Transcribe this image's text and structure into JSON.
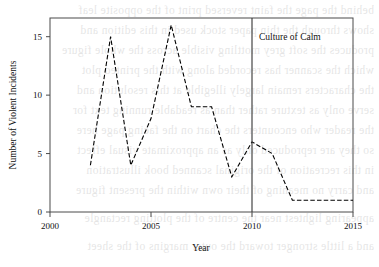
{
  "chart_data": {
    "type": "line",
    "title": "",
    "xlabel": "Year",
    "ylabel": "Number of Violent Incidents",
    "xlim": [
      2000,
      2015
    ],
    "ylim": [
      0,
      16.6
    ],
    "grid": false,
    "legend": "none",
    "x": [
      2002,
      2003,
      2004,
      2005,
      2006,
      2007,
      2008,
      2009,
      2010,
      2011,
      2012,
      2013,
      2014,
      2015
    ],
    "values": [
      4,
      15,
      4,
      8,
      16,
      9,
      9,
      3,
      6,
      5,
      1,
      1,
      1,
      1
    ],
    "series": [
      {
        "name": "Violent incidents",
        "values": [
          4,
          15,
          4,
          8,
          16,
          9,
          9,
          3,
          6,
          5,
          1,
          1,
          1,
          1
        ]
      }
    ],
    "xticks": [
      2000,
      2005,
      2010,
      2015
    ],
    "xtick_labels": [
      "2000",
      "2005",
      "2010",
      "2015"
    ],
    "yticks": [
      0,
      5,
      10,
      15
    ],
    "ytick_labels": [
      "0",
      "5",
      "10",
      "15"
    ],
    "annotations": [
      {
        "type": "vline",
        "x": 2010,
        "label": "Culture of Calm"
      }
    ],
    "line_style": "dashed",
    "line_color": "#000000"
  },
  "axes": {
    "x_title": "Year",
    "y_title": "Number of Violent Incidents"
  },
  "annotation": {
    "culture_of_calm": "Culture of Calm"
  },
  "ghost_text": {
    "lines": [
      "behind the page the faint reversed print of the opposite leaf",
      "shows through the thin paper stock used in this edition and",
      "produces the soft grey mottling visible across the whole figure",
      "which the scanner has recorded along with the printed plot",
      "the characters remain largely illegible at this resolution and",
      "serve only as texture rather than as readable running text for",
      "the reader who encounters the chart on the facing page here",
      "so they are reproduced only as an approximate visual effect",
      "in this recreation of the original scanned book illustration",
      "and carry no meaning of their own within the present figure",
      "appearing lightest near the centre of the plotting rectangle",
      "and a little stronger toward the outer margins of the sheet"
    ]
  }
}
